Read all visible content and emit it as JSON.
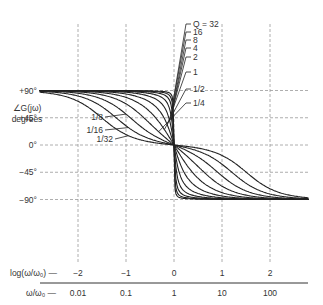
{
  "chart_data": {
    "type": "line",
    "title": "",
    "ylabel": "∠G(jω) degrees",
    "ylabel_line1": "∠G(jω)",
    "ylabel_line2": "degrees",
    "xlabel_log": "log(ω/ω₀) —",
    "xlabel_lin": "ω/ω₀ —",
    "x_log_ticks": [
      "−2",
      "−1",
      "0",
      "1",
      "2"
    ],
    "x_lin_ticks": [
      "0.01",
      "0.1",
      "1",
      "10",
      "100"
    ],
    "y_ticks": [
      "+90°",
      "+45°",
      "0°",
      "−45°",
      "−90°"
    ],
    "xlim_log": [
      -2.8,
      2.8
    ],
    "ylim": [
      -90,
      90
    ],
    "grid": true,
    "series": [
      {
        "name": "Q = 32",
        "Q": 32
      },
      {
        "name": "16",
        "Q": 16
      },
      {
        "name": "8",
        "Q": 8
      },
      {
        "name": "4",
        "Q": 4
      },
      {
        "name": "2",
        "Q": 2
      },
      {
        "name": "1",
        "Q": 1
      },
      {
        "name": "1/2",
        "Q": 0.5
      },
      {
        "name": "1/4",
        "Q": 0.25
      },
      {
        "name": "1/8",
        "Q": 0.125
      },
      {
        "name": "1/16",
        "Q": 0.0625
      },
      {
        "name": "1/32",
        "Q": 0.03125
      }
    ],
    "formula": "phase = arctan(Q·(ω₀/ω − ω/ω₀))"
  }
}
